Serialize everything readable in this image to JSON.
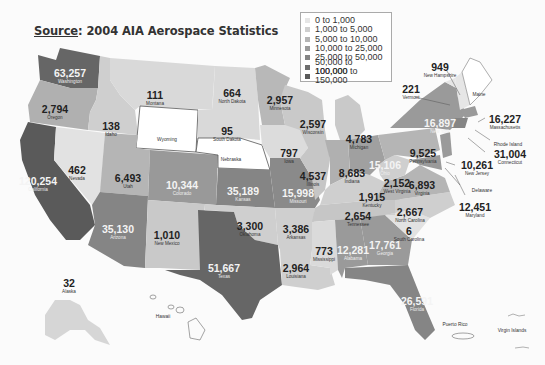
{
  "title": {
    "source_label": "Source",
    "text": ": 2004 AIA Aerospace Statistics"
  },
  "legend": {
    "items": [
      {
        "label": "0 to 1,000",
        "color": "#e6e6e6"
      },
      {
        "label": "1,000 to 5,000",
        "color": "#cfcfcf"
      },
      {
        "label": "5,000 to 10,000",
        "color": "#b5b5b5"
      },
      {
        "label": "10,000 to 25,000",
        "color": "#9a9a9a"
      },
      {
        "label": "25,000 to 50,000",
        "color": "#858585"
      },
      {
        "label": "50,000 to 100,000",
        "color": "#6e6e6e"
      },
      {
        "label": "100,000 to 150,000",
        "color": "#5a5a5a"
      }
    ]
  },
  "states": {
    "washington": {
      "value": "63,257",
      "name": "Washington"
    },
    "oregon": {
      "value": "2,794",
      "name": "Oregon"
    },
    "california": {
      "value": "120,254",
      "name": "California"
    },
    "idaho": {
      "value": "138",
      "name": "Idaho"
    },
    "nevada": {
      "value": "462",
      "name": "Nevada"
    },
    "montana": {
      "value": "111",
      "name": "Montana"
    },
    "wyoming": {
      "value": "",
      "name": "Wyoming"
    },
    "utah": {
      "value": "6,493",
      "name": "Utah"
    },
    "arizona": {
      "value": "35,130",
      "name": "Arizona"
    },
    "colorado": {
      "value": "10,344",
      "name": "Colorado"
    },
    "new_mexico": {
      "value": "1,010",
      "name": "New Mexico"
    },
    "north_dakota": {
      "value": "664",
      "name": "North Dakota"
    },
    "south_dakota": {
      "value": "95",
      "name": "South Dakota"
    },
    "nebraska": {
      "value": "",
      "name": "Nebraska"
    },
    "kansas": {
      "value": "35,189",
      "name": "Kansas"
    },
    "oklahoma": {
      "value": "3,300",
      "name": "Oklahoma"
    },
    "texas": {
      "value": "51,667",
      "name": "Texas"
    },
    "minnesota": {
      "value": "2,957",
      "name": "Minnesota"
    },
    "iowa": {
      "value": "797",
      "name": "Iowa"
    },
    "missouri": {
      "value": "15,998",
      "name": "Missouri"
    },
    "arkansas": {
      "value": "3,386",
      "name": "Arkansas"
    },
    "louisiana": {
      "value": "2,964",
      "name": "Louisiana"
    },
    "wisconsin": {
      "value": "2,597",
      "name": "Wisconsin"
    },
    "illinois": {
      "value": "4,537",
      "name": "Illinois"
    },
    "michigan": {
      "value": "4,783",
      "name": "Michigan"
    },
    "indiana": {
      "value": "8,683",
      "name": "Indiana"
    },
    "ohio": {
      "value": "15,106",
      "name": "Ohio"
    },
    "kentucky": {
      "value": "1,915",
      "name": "Kentucky"
    },
    "tennessee": {
      "value": "2,654",
      "name": "Tennessee"
    },
    "mississippi": {
      "value": "773",
      "name": "Mississippi"
    },
    "alabama": {
      "value": "12,281",
      "name": "Alabama"
    },
    "georgia": {
      "value": "17,761",
      "name": "Georgia"
    },
    "florida": {
      "value": "26,591",
      "name": "Florida"
    },
    "south_carolina": {
      "value": "6",
      "name": "South Carolina"
    },
    "north_carolina": {
      "value": "2,667",
      "name": "North Carolina"
    },
    "virginia": {
      "value": "6,893",
      "name": "Virginia"
    },
    "west_virginia": {
      "value": "2,152",
      "name": "West Virginia"
    },
    "pennsylvania": {
      "value": "9,525",
      "name": "Pennsylvania"
    },
    "new_york": {
      "value": "16,897",
      "name": "New York"
    },
    "vermont": {
      "value": "221",
      "name": "Vermont"
    },
    "new_hampshire": {
      "value": "949",
      "name": "New Hampshire"
    },
    "maine": {
      "value": "",
      "name": "Maine"
    },
    "massachusetts": {
      "value": "16,227",
      "name": "Massachusetts"
    },
    "rhode_island": {
      "value": "",
      "name": "Rhode Island"
    },
    "connecticut": {
      "value": "31,004",
      "name": "Connecticut"
    },
    "new_jersey": {
      "value": "10,261",
      "name": "New Jersey"
    },
    "delaware": {
      "value": "",
      "name": "Delaware"
    },
    "maryland": {
      "value": "12,451",
      "name": "Maryland"
    },
    "alaska": {
      "value": "32",
      "name": "Alaska"
    },
    "hawaii": {
      "value": "",
      "name": "Hawaii"
    },
    "puerto_rico": {
      "value": "",
      "name": "Puerto Rico"
    },
    "virgin_islands": {
      "value": "",
      "name": "Virgin Islands"
    }
  }
}
